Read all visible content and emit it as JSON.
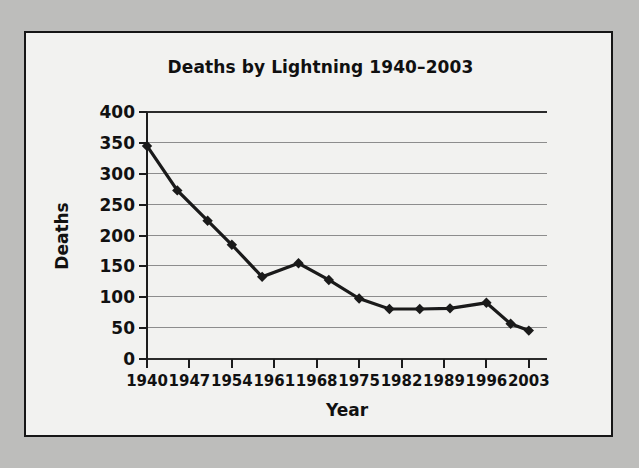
{
  "chart_data": {
    "type": "line",
    "title": "Deaths by Lightning 1940–2003",
    "xlabel": "Year",
    "ylabel": "Deaths",
    "x": [
      1940,
      1945,
      1950,
      1954,
      1959,
      1965,
      1970,
      1975,
      1980,
      1985,
      1990,
      1996,
      2000,
      2003
    ],
    "values": [
      345,
      273,
      224,
      185,
      133,
      155,
      128,
      98,
      81,
      81,
      82,
      91,
      57,
      46
    ],
    "categories": [
      "1940",
      "1945",
      "1950",
      "1954",
      "1959",
      "1965",
      "1970",
      "1975",
      "1980",
      "1985",
      "1990",
      "1996",
      "2000",
      "2003"
    ],
    "xticks": [
      "1940",
      "1947",
      "1954",
      "1961",
      "1968",
      "1975",
      "1982",
      "1989",
      "1996",
      "2003"
    ],
    "xtick_values": [
      1940,
      1947,
      1954,
      1961,
      1968,
      1975,
      1982,
      1989,
      1996,
      2003
    ],
    "yticks": [
      "0",
      "50",
      "100",
      "150",
      "200",
      "250",
      "300",
      "350",
      "400"
    ],
    "ytick_values": [
      0,
      50,
      100,
      150,
      200,
      250,
      300,
      350,
      400
    ],
    "xlim": [
      1940,
      2006
    ],
    "ylim": [
      0,
      400
    ],
    "grid": true,
    "legend": "none",
    "marker": "diamond",
    "series_color": "#1a1a1a",
    "grid_color": "#8d8d8d",
    "background_color": "#f2f2f0",
    "page_color": "#bdbdbb",
    "border_color": "#161616"
  }
}
